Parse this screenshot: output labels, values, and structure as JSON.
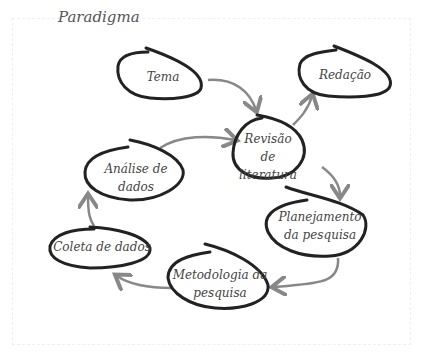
{
  "title": "Paradigma",
  "nodes": [
    {
      "id": "tema",
      "label": "Tema"
    },
    {
      "id": "redacao",
      "label": "Redação"
    },
    {
      "id": "revisao",
      "label": "Revisão de literatura"
    },
    {
      "id": "analise",
      "label": "Análise de dados"
    },
    {
      "id": "planejamento",
      "label": "Planejamento da pesquisa"
    },
    {
      "id": "coleta",
      "label": "Coleta de dados"
    },
    {
      "id": "metodologia",
      "label": "Metodologia da pesquisa"
    }
  ],
  "edges": [
    {
      "from": "tema",
      "to": "revisao"
    },
    {
      "from": "revisao",
      "to": "redacao"
    },
    {
      "from": "revisao",
      "to": "planejamento"
    },
    {
      "from": "planejamento",
      "to": "metodologia"
    },
    {
      "from": "metodologia",
      "to": "coleta"
    },
    {
      "from": "coleta",
      "to": "analise"
    },
    {
      "from": "analise",
      "to": "revisao"
    }
  ],
  "colors": {
    "outline": "#222222",
    "arrow": "#888888",
    "text": "#444444"
  }
}
